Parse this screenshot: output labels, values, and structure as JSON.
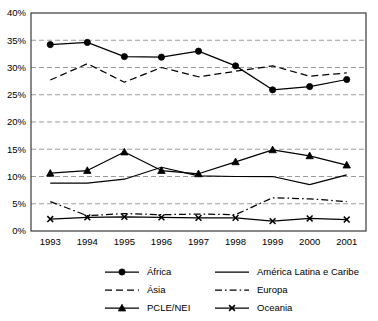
{
  "chart_data": {
    "type": "line",
    "title": "",
    "xlabel": "",
    "ylabel": "",
    "grid": true,
    "legend_position": "bottom",
    "x": [
      "1993",
      "1994",
      "1995",
      "1996",
      "1997",
      "1998",
      "1999",
      "2000",
      "2001"
    ],
    "categories": [
      "1993",
      "1994",
      "1995",
      "1996",
      "1997",
      "1998",
      "1999",
      "2000",
      "2001"
    ],
    "ylim": [
      0,
      40
    ],
    "ytick_labels": [
      "0%",
      "5%",
      "10%",
      "15%",
      "20%",
      "25%",
      "30%",
      "35%",
      "40%"
    ],
    "ytick_values": [
      0,
      5,
      10,
      15,
      20,
      25,
      30,
      35,
      40
    ],
    "series": [
      {
        "name": "África",
        "style": "solid",
        "marker": "circle",
        "values": [
          34.2,
          34.6,
          32.0,
          31.9,
          33.0,
          30.3,
          25.9,
          26.5,
          27.8
        ]
      },
      {
        "name": "América Latina e Caribe",
        "style": "solid",
        "marker": "none",
        "values": [
          8.8,
          8.8,
          9.5,
          11.7,
          10.1,
          10.0,
          10.0,
          8.5,
          10.3
        ]
      },
      {
        "name": "Ásia",
        "style": "dashed",
        "marker": "none",
        "values": [
          27.7,
          30.7,
          27.3,
          30.0,
          28.3,
          29.3,
          30.3,
          28.4,
          29.0
        ]
      },
      {
        "name": "Europa",
        "style": "dashdot",
        "marker": "none",
        "values": [
          5.4,
          2.8,
          3.2,
          3.0,
          3.1,
          3.0,
          6.1,
          5.9,
          5.4
        ]
      },
      {
        "name": "PCLE/NEI",
        "style": "solid",
        "marker": "triangle",
        "values": [
          10.6,
          11.1,
          14.5,
          11.1,
          10.5,
          12.7,
          14.9,
          13.8,
          12.1
        ]
      },
      {
        "name": "Oceania",
        "style": "solid",
        "marker": "cross",
        "values": [
          2.2,
          2.5,
          2.6,
          2.5,
          2.4,
          2.4,
          1.8,
          2.3,
          2.1
        ]
      }
    ]
  },
  "legend": {
    "entries": [
      {
        "label": "África"
      },
      {
        "label": "América Latina e Caribe"
      },
      {
        "label": "Ásia"
      },
      {
        "label": "Europa"
      },
      {
        "label": "PCLE/NEI"
      },
      {
        "label": "Oceania"
      }
    ]
  },
  "colors": {
    "line": "#000000",
    "grid": "#9a9a9a",
    "frame": "#3a3a3a",
    "background": "#ffffff"
  }
}
